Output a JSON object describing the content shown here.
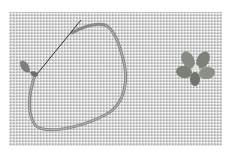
{
  "image": {
    "description": "Photograph of a looped ribbon hairpin with a thin needle and a small flower-shaped ornament on a woven fabric background",
    "subjects": [
      "hairpin-loop",
      "needle",
      "flower-ornament"
    ],
    "colors": {
      "background": "#d2d2d2",
      "margin": "#ffffff",
      "object": "#8a8a8a",
      "flower": "#7f857c",
      "needle": "#333333"
    }
  }
}
